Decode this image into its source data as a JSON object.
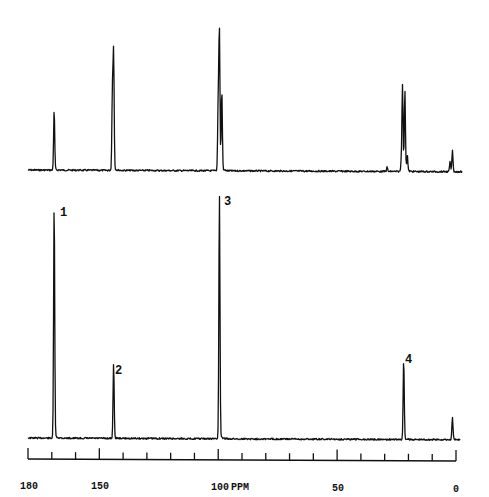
{
  "chart_data": {
    "type": "line",
    "title": "",
    "xlabel": "PPM",
    "ylabel": "",
    "xlim": [
      180,
      0
    ],
    "x_axis": {
      "reversed": true,
      "major_ticks": [
        180,
        150,
        100,
        50,
        0
      ],
      "minor_ticks": [
        170,
        160,
        140,
        130,
        120,
        110,
        90,
        80,
        70,
        60,
        40,
        30,
        20,
        10
      ],
      "tick_labels": [
        "180",
        "150",
        "100",
        "50",
        "0"
      ],
      "unit_label": "PPM"
    },
    "grid": false,
    "legend": null,
    "series": [
      {
        "name": "upper spectrum",
        "panel": "top",
        "peaks": [
          {
            "ppm": 169,
            "rel_height": 0.43
          },
          {
            "ppm": 144.5,
            "rel_height": 0.56
          },
          {
            "ppm": 144,
            "rel_height": 0.83
          },
          {
            "ppm": 100,
            "rel_height": 0.5
          },
          {
            "ppm": 99.5,
            "rel_height": 1.0
          },
          {
            "ppm": 98.5,
            "rel_height": 0.58
          },
          {
            "ppm": 29,
            "rel_height": 0.03
          },
          {
            "ppm": 23,
            "rel_height": 0.07
          },
          {
            "ppm": 22.5,
            "rel_height": 0.63
          },
          {
            "ppm": 21.5,
            "rel_height": 0.58
          },
          {
            "ppm": 20.5,
            "rel_height": 0.12
          },
          {
            "ppm": 2.5,
            "rel_height": 0.07
          },
          {
            "ppm": 1.5,
            "rel_height": 0.15
          }
        ]
      },
      {
        "name": "lower spectrum",
        "panel": "bottom",
        "peaks": [
          {
            "ppm": 169,
            "rel_height": 0.97,
            "label": "1"
          },
          {
            "ppm": 144,
            "rel_height": 0.31,
            "label": "2"
          },
          {
            "ppm": 99.5,
            "rel_height": 1.0,
            "label": "3"
          },
          {
            "ppm": 22,
            "rel_height": 0.33,
            "label": "4"
          },
          {
            "ppm": 1.5,
            "rel_height": 0.09
          }
        ]
      }
    ],
    "annotations": [
      "1",
      "2",
      "3",
      "4"
    ]
  },
  "axis": {
    "label_180": "180",
    "label_150": "150",
    "label_100": "100",
    "label_ppm": "PPM",
    "label_50": "50",
    "label_0": "0"
  },
  "peak_labels": {
    "p1": "1",
    "p2": "2",
    "p3": "3",
    "p4": "4"
  }
}
